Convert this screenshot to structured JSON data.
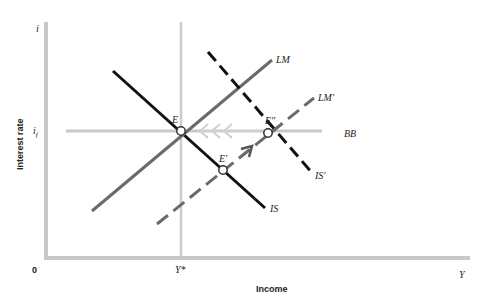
{
  "diagram": {
    "title": "",
    "axes": {
      "y_axis_symbol": "i",
      "y_axis_label": "Interest rate",
      "x_axis_symbol": "Y",
      "x_axis_label": "Income",
      "origin": "0",
      "y_tick_label": "i_f",
      "y_tick_main": "i",
      "y_tick_sub": "f",
      "x_tick_label": "Y*"
    },
    "curves": {
      "IS": "IS",
      "IS_prime": "IS'",
      "LM": "LM",
      "LM_prime": "LM'",
      "BB": "BB"
    },
    "points": {
      "E": "E",
      "E_prime": "E'",
      "E_double_prime": "E\""
    },
    "colors": {
      "axis": "#c8c8c8",
      "bb_line": "#c8c8c8",
      "is_line": "#111111",
      "lm_line": "#6a6a6a",
      "arrow_light": "#cfcfcf",
      "arrow_dark": "#555555"
    }
  }
}
